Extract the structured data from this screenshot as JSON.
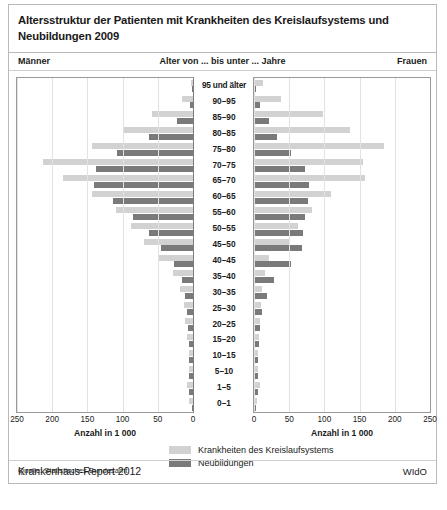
{
  "title": "Altersstruktur der Patienten mit Krankheiten des Kreislaufsystems und Neubildungen 2009",
  "header": {
    "left": "Männer",
    "center": "Alter von ... bis unter ... Jahre",
    "right": "Frauen"
  },
  "axis": {
    "left_title": "Anzahl in 1 000",
    "right_title": "Anzahl in 1 000",
    "left_ticks": [
      "250",
      "200",
      "150",
      "100",
      "50",
      "0"
    ],
    "right_ticks": [
      "0",
      "50",
      "100",
      "150",
      "200",
      "250"
    ]
  },
  "legend": {
    "items": [
      {
        "label": "Krankheiten des Kreislaufsystems",
        "color": "#d2d2d2"
      },
      {
        "label": "Neubildungen",
        "color": "#7a7a7a"
      }
    ]
  },
  "footer": {
    "source": "Quelle: Statistisches Bundesamt",
    "report": "Krankenhaus-Report 2012",
    "institute": "WIdO"
  },
  "chart_data": {
    "type": "bar",
    "subtype": "population-pyramid",
    "title": "Altersstruktur der Patienten mit Krankheiten des Kreislaufsystems und Neubildungen 2009",
    "xlabel": "Anzahl in 1 000",
    "ylabel": "Alter von ... bis unter ... Jahre",
    "xlim": [
      0,
      250
    ],
    "grid": true,
    "grid_step": 50,
    "legend_position": "bottom-center",
    "categories": [
      "95 und älter",
      "90–95",
      "85–90",
      "80–85",
      "75–80",
      "70–75",
      "65–70",
      "60–65",
      "55–60",
      "50–55",
      "45–50",
      "40–45",
      "35–40",
      "30–35",
      "25–30",
      "20–25",
      "15–20",
      "10–15",
      "5–10",
      "1–5",
      "0–1"
    ],
    "series": [
      {
        "name": "Männer – Krankheiten des Kreislaufsystems",
        "side": "left",
        "color": "#d2d2d2",
        "values": [
          3,
          15,
          58,
          100,
          143,
          213,
          185,
          143,
          110,
          88,
          70,
          48,
          28,
          18,
          13,
          11,
          8,
          6,
          6,
          9,
          5
        ]
      },
      {
        "name": "Männer – Neubildungen",
        "side": "left",
        "color": "#7a7a7a",
        "values": [
          1,
          4,
          23,
          63,
          108,
          138,
          140,
          113,
          85,
          62,
          45,
          27,
          16,
          11,
          8,
          7,
          6,
          5,
          5,
          6,
          2
        ]
      },
      {
        "name": "Frauen – Krankheiten des Kreislaufsystems",
        "side": "right",
        "color": "#d2d2d2",
        "values": [
          13,
          38,
          98,
          137,
          185,
          155,
          158,
          110,
          82,
          62,
          50,
          22,
          16,
          12,
          10,
          9,
          7,
          5,
          5,
          8,
          4
        ]
      },
      {
        "name": "Frauen – Neubildungen",
        "side": "right",
        "color": "#7a7a7a",
        "values": [
          3,
          8,
          22,
          33,
          53,
          72,
          78,
          77,
          73,
          70,
          68,
          53,
          28,
          18,
          12,
          9,
          7,
          5,
          5,
          5,
          2
        ]
      }
    ]
  }
}
